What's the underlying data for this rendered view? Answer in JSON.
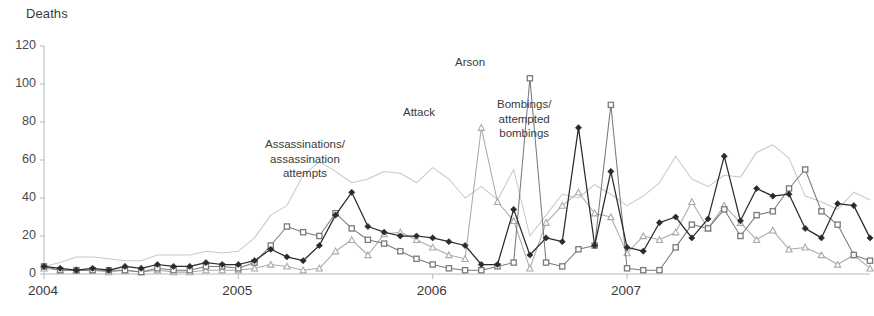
{
  "chart_data": {
    "type": "line",
    "title": "",
    "ylabel": "Deaths",
    "xlabel": "",
    "ylim": [
      0,
      120
    ],
    "yticks": [
      0,
      20,
      40,
      60,
      80,
      100,
      120
    ],
    "xticks": [
      "2004",
      "2005",
      "2006",
      "2007"
    ],
    "grid": false,
    "legend_position": "inline-annotations",
    "x_count": 48,
    "x_start": "2004-01",
    "x_step": "month",
    "annotations": [
      {
        "text": "Assassinations/\nassassination\nattempts",
        "line1": "Assassinations/",
        "line2": "assassination",
        "line3": "attempts",
        "x_px": 265,
        "y_px": 137
      },
      {
        "text": "Attack",
        "line1": "Attack",
        "x_px": 403,
        "y_px": 105
      },
      {
        "text": "Arson",
        "line1": "Arson",
        "x_px": 455,
        "y_px": 55
      },
      {
        "text": "Bombings/\nattempted\nbombings",
        "line1": "Bombings/",
        "line2": "attempted",
        "line3": "bombings",
        "x_px": 497,
        "y_px": 97
      }
    ],
    "series": [
      {
        "name": "Bombings/attempted bombings",
        "color": "#2b2b2b",
        "marker": "diamond",
        "values": [
          4,
          3,
          2,
          3,
          2,
          4,
          3,
          5,
          4,
          4,
          6,
          5,
          5,
          7,
          13,
          9,
          7,
          15,
          31,
          43,
          25,
          22,
          20,
          20,
          19,
          17,
          15,
          5,
          5,
          34,
          10,
          19,
          17,
          77,
          15,
          54,
          14,
          12,
          27,
          30,
          19,
          29,
          62,
          28,
          45,
          41,
          42,
          24,
          19,
          37,
          36,
          19
        ]
      },
      {
        "name": "Arson",
        "color": "#7a7a7a",
        "marker": "square",
        "values": [
          4,
          2,
          2,
          2,
          2,
          2,
          1,
          3,
          2,
          2,
          4,
          4,
          3,
          6,
          15,
          25,
          22,
          20,
          32,
          24,
          18,
          16,
          12,
          8,
          5,
          3,
          2,
          2,
          4,
          6,
          103,
          6,
          4,
          13,
          15,
          89,
          3,
          2,
          2,
          14,
          26,
          24,
          34,
          20,
          31,
          33,
          45,
          55,
          33,
          26,
          10,
          7
        ]
      },
      {
        "name": "Attack",
        "color": "#aaaaaa",
        "marker": "triangle",
        "values": [
          3,
          2,
          2,
          2,
          1,
          2,
          1,
          2,
          1,
          1,
          2,
          2,
          2,
          3,
          5,
          4,
          2,
          3,
          12,
          18,
          10,
          21,
          22,
          18,
          14,
          10,
          8,
          77,
          38,
          28,
          3,
          27,
          36,
          43,
          32,
          30,
          11,
          20,
          18,
          22,
          38,
          24,
          36,
          27,
          18,
          23,
          13,
          14,
          10,
          5,
          10,
          3
        ]
      },
      {
        "name": "Assassinations/assassination attempts",
        "color": "#c9c9c9",
        "marker": "none",
        "values": [
          4,
          6,
          9,
          9,
          8,
          7,
          7,
          10,
          10,
          10,
          12,
          11,
          12,
          19,
          31,
          36,
          52,
          59,
          54,
          48,
          50,
          54,
          53,
          48,
          56,
          50,
          40,
          46,
          39,
          55,
          20,
          31,
          42,
          40,
          47,
          42,
          36,
          41,
          48,
          62,
          50,
          46,
          52,
          51,
          64,
          68,
          61,
          41,
          38,
          34,
          43,
          39
        ]
      }
    ]
  }
}
